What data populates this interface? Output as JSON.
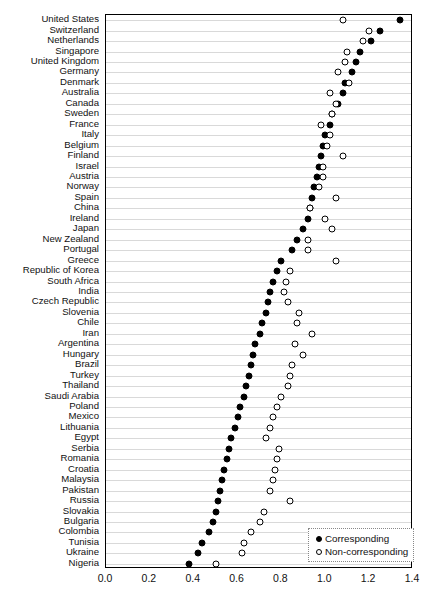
{
  "chart_data": {
    "type": "scatter",
    "title": "",
    "subtitle": "",
    "xlabel": "",
    "ylabel": "",
    "xlim": [
      0.0,
      1.4
    ],
    "ylim": null,
    "grid": "horizontal",
    "legend_position": "bottom-right",
    "xticks": [
      "0.0",
      "0.2",
      "0.4",
      "0.6",
      "0.8",
      "1.0",
      "1.2",
      "1.4"
    ],
    "xtick_values": [
      0.0,
      0.2,
      0.4,
      0.6,
      0.8,
      1.0,
      1.2,
      1.4
    ],
    "legend": [
      {
        "key": "corresponding",
        "label": "Corresponding",
        "marker": "filled-circle",
        "color": "#000000"
      },
      {
        "key": "non_corresponding",
        "label": "Non-corresponding",
        "marker": "open-circle",
        "color": "#000000"
      }
    ],
    "categories": [
      "United States",
      "Switzerland",
      "Netherlands",
      "Singapore",
      "United Kingdom",
      "Germany",
      "Denmark",
      "Australia",
      "Canada",
      "Sweden",
      "France",
      "Italy",
      "Belgium",
      "Finland",
      "Israel",
      "Austria",
      "Norway",
      "Spain",
      "China",
      "Ireland",
      "Japan",
      "New Zealand",
      "Portugal",
      "Greece",
      "Republic of Korea",
      "South Africa",
      "India",
      "Czech Republic",
      "Slovenia",
      "Chile",
      "Iran",
      "Argentina",
      "Hungary",
      "Brazil",
      "Turkey",
      "Thailand",
      "Saudi Arabia",
      "Poland",
      "Mexico",
      "Lithuania",
      "Egypt",
      "Serbia",
      "Romania",
      "Croatia",
      "Malaysia",
      "Pakistan",
      "Russia",
      "Slovakia",
      "Bulgaria",
      "Colombia",
      "Tunisia",
      "Ukraine",
      "Nigeria"
    ],
    "series": [
      {
        "name": "Corresponding",
        "marker": "filled-circle",
        "values": [
          1.34,
          1.25,
          1.21,
          1.16,
          1.14,
          1.12,
          1.09,
          1.08,
          1.06,
          1.03,
          1.02,
          1.0,
          0.99,
          0.98,
          0.97,
          0.96,
          0.95,
          0.94,
          0.93,
          0.92,
          0.9,
          0.87,
          0.85,
          0.8,
          0.78,
          0.76,
          0.75,
          0.74,
          0.73,
          0.71,
          0.7,
          0.68,
          0.67,
          0.66,
          0.65,
          0.64,
          0.63,
          0.61,
          0.6,
          0.59,
          0.57,
          0.56,
          0.55,
          0.54,
          0.53,
          0.52,
          0.51,
          0.5,
          0.49,
          0.47,
          0.44,
          0.42,
          0.38
        ]
      },
      {
        "name": "Non-corresponding",
        "marker": "open-circle",
        "values": [
          1.08,
          1.2,
          1.17,
          1.1,
          1.09,
          1.06,
          1.11,
          1.02,
          1.05,
          1.03,
          0.98,
          1.02,
          1.01,
          1.08,
          0.99,
          0.99,
          0.97,
          1.05,
          0.93,
          1.0,
          1.03,
          0.92,
          0.92,
          1.05,
          0.84,
          0.82,
          0.81,
          0.83,
          0.88,
          0.87,
          0.94,
          0.86,
          0.9,
          0.85,
          0.84,
          0.83,
          0.8,
          0.78,
          0.76,
          0.75,
          0.73,
          0.79,
          0.78,
          0.77,
          0.76,
          0.75,
          0.84,
          0.72,
          0.7,
          0.66,
          0.63,
          0.62,
          0.5
        ]
      }
    ]
  }
}
